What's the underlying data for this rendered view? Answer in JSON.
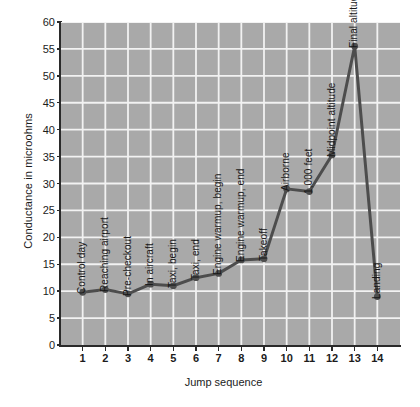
{
  "chart_data": {
    "type": "line",
    "title": "",
    "xlabel": "Jump sequence",
    "ylabel": "Conductance in microohms",
    "xlim": [
      0,
      15
    ],
    "ylim": [
      0,
      60
    ],
    "xticks": [
      "1",
      "2",
      "3",
      "4",
      "5",
      "6",
      "7",
      "8",
      "9",
      "10",
      "11",
      "12",
      "13",
      "14"
    ],
    "yticks": [
      "0",
      "5",
      "10",
      "15",
      "20",
      "25",
      "30",
      "35",
      "40",
      "45",
      "50",
      "55",
      "60"
    ],
    "grid": true,
    "legend": "none",
    "x": [
      1,
      2,
      3,
      4,
      5,
      6,
      7,
      8,
      9,
      10,
      11,
      12,
      13,
      14
    ],
    "values": [
      9.8,
      10.3,
      9.5,
      11.3,
      11.0,
      12.5,
      13.3,
      15.8,
      16.0,
      29.0,
      28.5,
      35.3,
      55.5,
      9.0
    ],
    "point_labels": [
      "Control day",
      "Reaching airport",
      "Pre-checkout",
      "In aircraft",
      "Taxi, begin",
      "Taxi, end",
      "Engine warmup, begin",
      "Engine warmup, end",
      "Takeoff",
      "Airborne",
      "1,000 feet",
      "Midpoint altitude",
      "Final altitude",
      "Landing"
    ],
    "colors": {
      "plot_background": "#a9a9a9",
      "gridline": "#f2f2f2",
      "line": "#4d4d4d",
      "marker": "#4d4d4d",
      "axis": "#2a2a2a",
      "text": "#1c1c1c",
      "page_background": "#ffffff"
    }
  }
}
